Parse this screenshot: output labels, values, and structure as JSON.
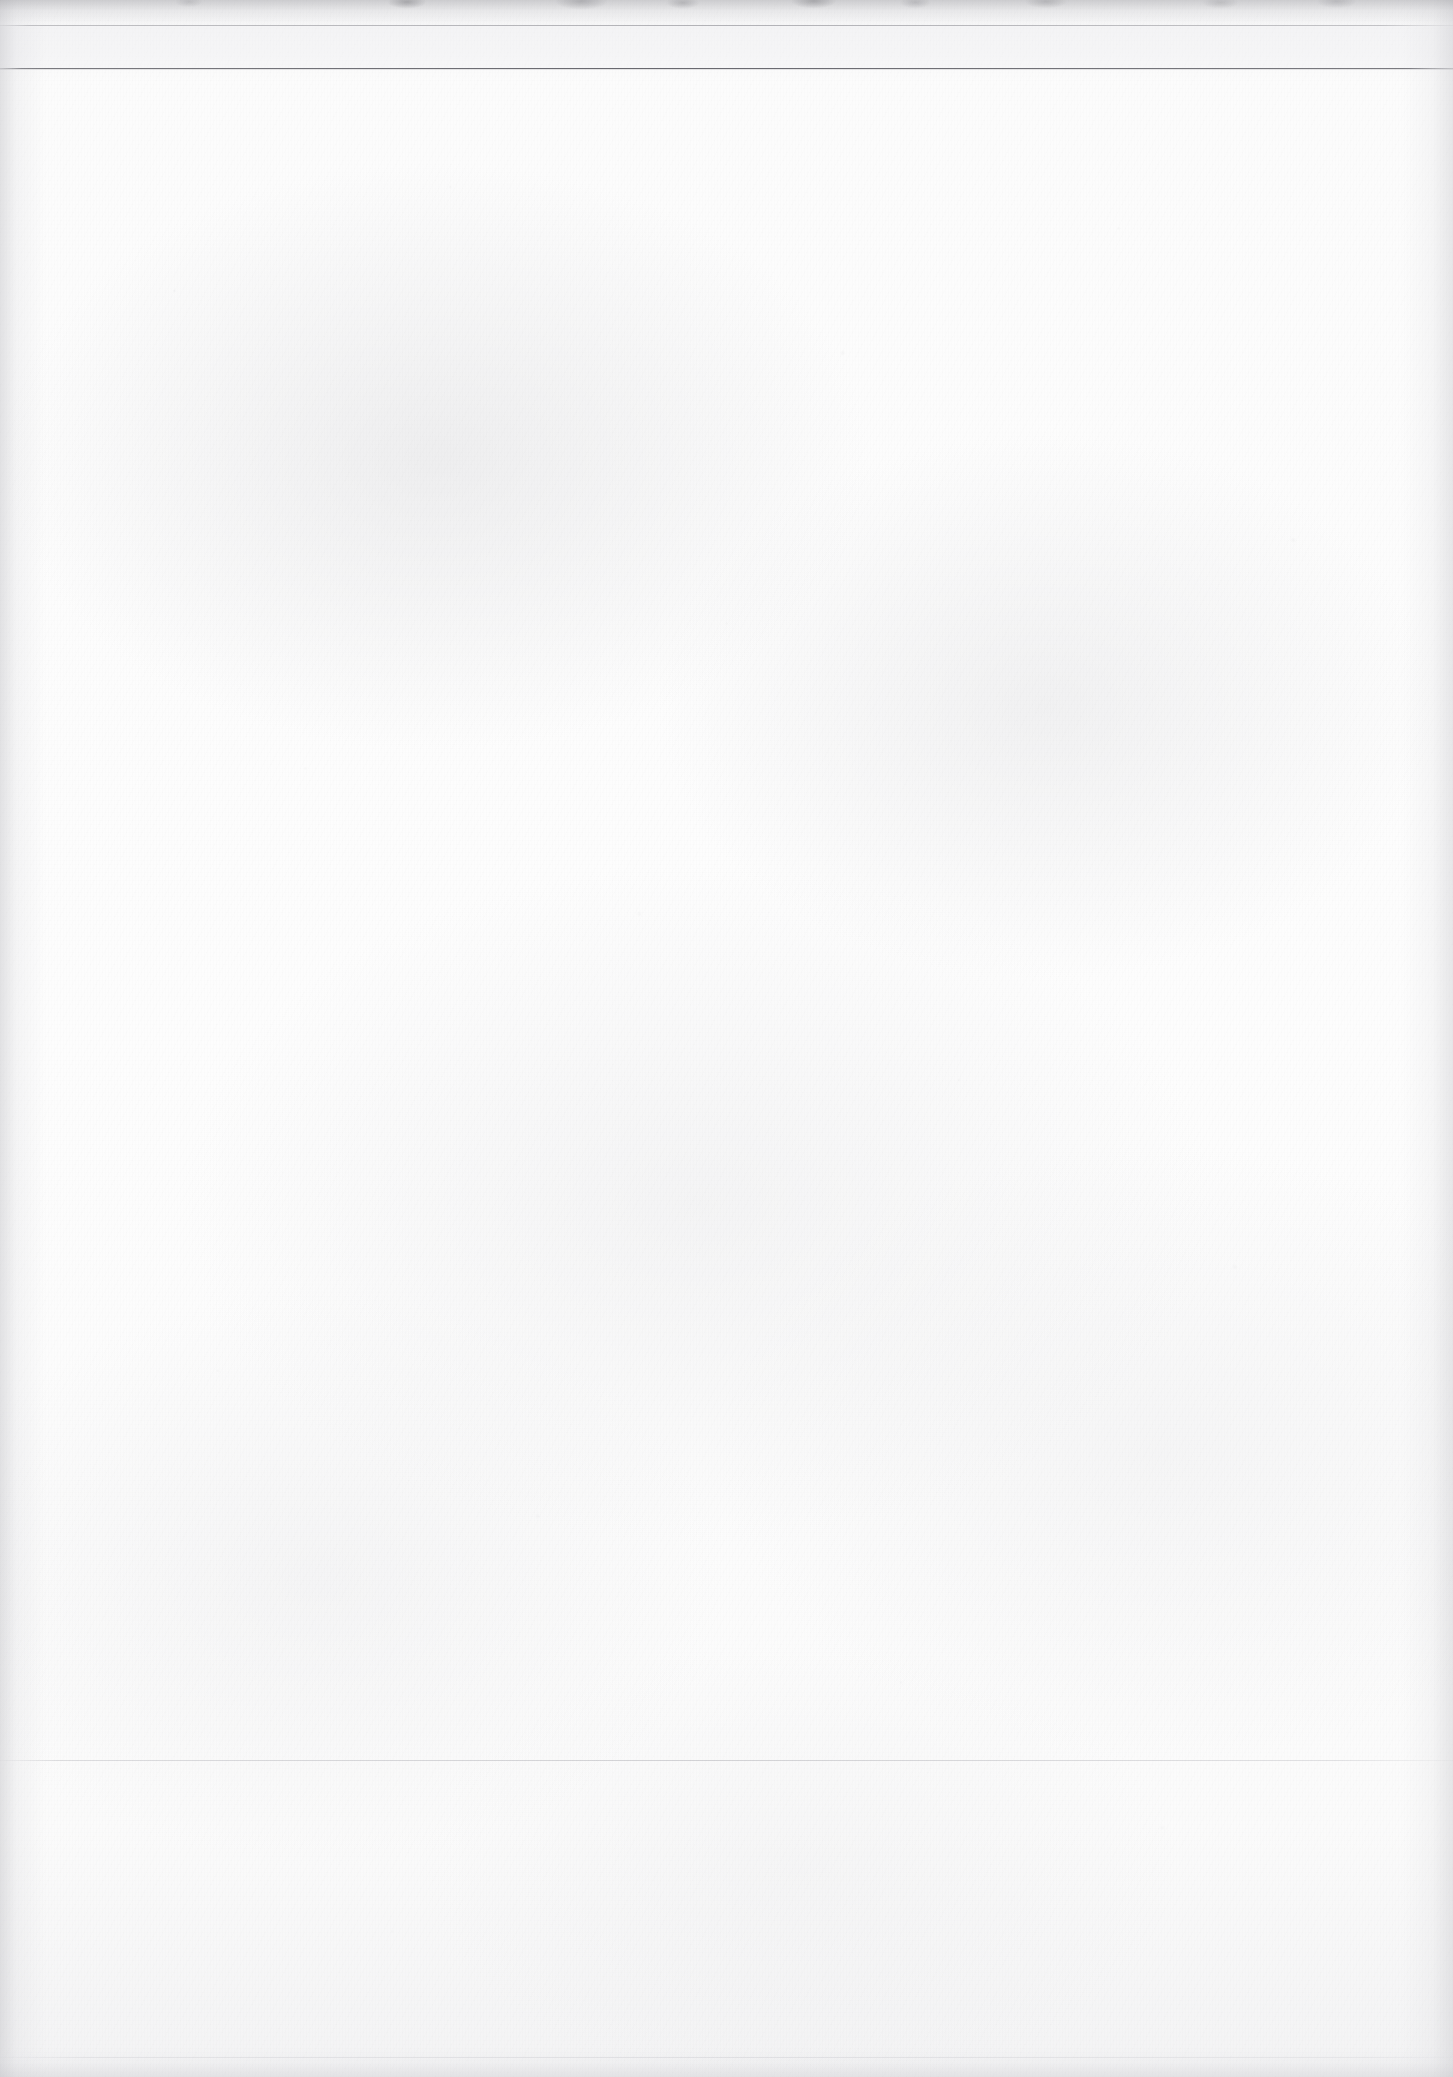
{
  "document": {
    "kind": "scanned-page",
    "page_state": "blank",
    "background_color": "#fbfbfb",
    "ink_color": "#606067",
    "width_px": 1453,
    "height_px": 2077
  },
  "header": {
    "running_head": "",
    "folio": ""
  },
  "body": {
    "blank_note": ""
  },
  "footer": {
    "footer_text": ""
  },
  "rules": [
    {
      "name": "faint-top-rule",
      "y": 25,
      "color": "#9a9aa0",
      "weight_px": 1,
      "opacity": 0.72
    },
    {
      "name": "main-top-rule",
      "y": 68,
      "color": "#60606a",
      "weight_px": 1,
      "opacity": 0.95
    },
    {
      "name": "faint-lower-rule",
      "y": 1760,
      "color": "#acacb2",
      "weight_px": 1,
      "opacity": 0.5
    },
    {
      "name": "faint-bottom-rule",
      "y": 2057,
      "color": "#bcbcc2",
      "weight_px": 1,
      "opacity": 0.34
    }
  ],
  "scan_artifacts": {
    "left_edge_shadow": true,
    "right_edge_shadow": true,
    "top_edge_shadow": true,
    "bottom_edge_shadow": true,
    "top_edge_smudges": true,
    "paper_grain": true,
    "speckle": true
  }
}
